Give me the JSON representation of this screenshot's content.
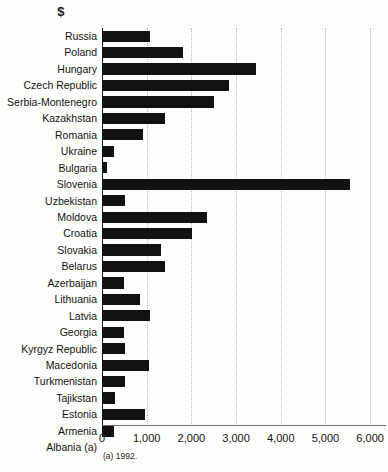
{
  "figure": {
    "unit_header": "$",
    "footnote": "(a) 1992."
  },
  "chart_data": {
    "type": "bar",
    "orientation": "horizontal",
    "title": "",
    "subtitle": "",
    "xlabel": "$",
    "ylabel": "",
    "xlim": [
      0,
      6400
    ],
    "ylim": [
      0,
      24
    ],
    "grid": true,
    "grid_axis": "x",
    "legend": false,
    "legend_position": "none",
    "bar_color": "#121212",
    "gridline_color": "#b9b9b9",
    "axis_color": "#6d6d6d",
    "tick_values": [
      0,
      1000,
      2000,
      3000,
      4000,
      5000,
      6000
    ],
    "tick_labels": [
      "0",
      "1,000",
      "2,000",
      "3,000",
      "4,000",
      "5,000",
      "6,000"
    ],
    "categories": [
      "Russia",
      "Poland",
      "Hungary",
      "Czech Republic",
      "Serbia-Montenegro",
      "Kazakhstan",
      "Romania",
      "Ukraine",
      "Bulgaria",
      "Slovenia",
      "Uzbekistan",
      "Moldova",
      "Croatia",
      "Slovakia",
      "Belarus",
      "Azerbaijan",
      "Lithuania",
      "Latvia",
      "Georgia",
      "Kyrgyz Republic",
      "Macedonia",
      "Turkmenistan",
      "Tajikstan",
      "Estonia",
      "Armenia",
      "Albania (a)"
    ],
    "values": [
      1070,
      1820,
      3450,
      2840,
      2500,
      1420,
      910,
      270,
      120,
      5560,
      510,
      2360,
      2020,
      1310,
      1400,
      500,
      850,
      1070,
      490,
      520,
      1050,
      510,
      290,
      970,
      265,
      0
    ],
    "annotations": [
      {
        "text": "$",
        "role": "unit-header"
      },
      {
        "text": "(a) 1992.",
        "role": "footnote"
      }
    ]
  }
}
